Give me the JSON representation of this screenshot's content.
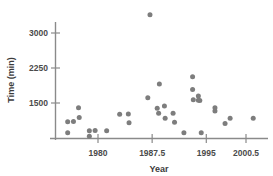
{
  "chart_data": {
    "type": "scatter",
    "title": "",
    "xlabel": "Year",
    "ylabel": "Time (min)",
    "xlim": [
      1975.2,
      2002.5
    ],
    "ylim": [
      700,
      3500
    ],
    "xticks": [
      1980,
      1987.5,
      1995,
      2000.5
    ],
    "xticklabels": [
      "1980",
      "1987.5",
      "1995",
      "2000.5"
    ],
    "yticks": [
      1500,
      2250,
      3000
    ],
    "yticklabels": [
      "1500",
      "2250",
      "3000"
    ],
    "grid": false,
    "legend": null,
    "marker_color": "#7d7d7d",
    "axis_color": "#8a8a8a",
    "points": [
      {
        "x": 1975.8,
        "y": 1100
      },
      {
        "x": 1975.8,
        "y": 860
      },
      {
        "x": 1976.6,
        "y": 1105
      },
      {
        "x": 1977.3,
        "y": 1400
      },
      {
        "x": 1977.4,
        "y": 1190
      },
      {
        "x": 1978.8,
        "y": 905
      },
      {
        "x": 1978.8,
        "y": 790
      },
      {
        "x": 1979.6,
        "y": 910
      },
      {
        "x": 1981.2,
        "y": 905
      },
      {
        "x": 1983.0,
        "y": 1260
      },
      {
        "x": 1984.2,
        "y": 1265
      },
      {
        "x": 1984.3,
        "y": 1075
      },
      {
        "x": 1987.2,
        "y": 3390
      },
      {
        "x": 1986.9,
        "y": 1610
      },
      {
        "x": 1988.5,
        "y": 1905
      },
      {
        "x": 1988.2,
        "y": 1390
      },
      {
        "x": 1988.4,
        "y": 1280
      },
      {
        "x": 1989.2,
        "y": 1435
      },
      {
        "x": 1989.3,
        "y": 1175
      },
      {
        "x": 1990.4,
        "y": 1280
      },
      {
        "x": 1990.6,
        "y": 1090
      },
      {
        "x": 1991.9,
        "y": 860
      },
      {
        "x": 1993.1,
        "y": 2060
      },
      {
        "x": 1993.1,
        "y": 1790
      },
      {
        "x": 1993.2,
        "y": 1570
      },
      {
        "x": 1993.9,
        "y": 1650
      },
      {
        "x": 1993.9,
        "y": 1560
      },
      {
        "x": 1994.1,
        "y": 1555
      },
      {
        "x": 1994.3,
        "y": 860
      },
      {
        "x": 1996.2,
        "y": 1400
      },
      {
        "x": 1996.2,
        "y": 1330
      },
      {
        "x": 1997.6,
        "y": 1060
      },
      {
        "x": 1998.3,
        "y": 1175
      },
      {
        "x": 2001.5,
        "y": 1175
      }
    ]
  },
  "axis_titles": {
    "x": "Year",
    "y": "Time (min)"
  }
}
